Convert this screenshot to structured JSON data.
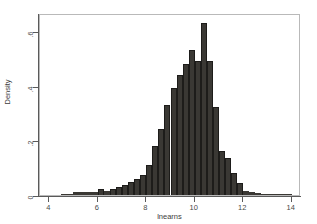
{
  "chart_data": {
    "type": "bar",
    "title": "",
    "subtitle": "",
    "xlabel": "lnearns",
    "ylabel": "Density",
    "xlim": [
      3.62,
      14.38
    ],
    "ylim": [
      0,
      0.665
    ],
    "grid": false,
    "legend": null,
    "bin_width": 0.25,
    "x_ticks": [
      {
        "value": 4,
        "label": "4"
      },
      {
        "value": 6,
        "label": "6"
      },
      {
        "value": 8,
        "label": "8"
      },
      {
        "value": 10,
        "label": "10"
      },
      {
        "value": 12,
        "label": "12"
      },
      {
        "value": 14,
        "label": "14"
      }
    ],
    "y_ticks": [
      {
        "value": 0,
        "label": "0"
      },
      {
        "value": 0.2,
        "label": ".2"
      },
      {
        "value": 0.4,
        "label": ".4"
      },
      {
        "value": 0.6,
        "label": ".6"
      }
    ],
    "bar_color": "#3a3834",
    "bar_edge_color": "#1d1c1a",
    "axis_color": "#5a5a5a",
    "frame_color": "#b9b9b9",
    "background_color": "#ffffff",
    "categories": [
      "4.50",
      "4.75",
      "5.00",
      "5.25",
      "5.50",
      "5.75",
      "6.00",
      "6.25",
      "6.50",
      "6.75",
      "7.00",
      "7.25",
      "7.50",
      "7.75",
      "8.00",
      "8.25",
      "8.50",
      "8.75",
      "9.00",
      "9.25",
      "9.50",
      "9.75",
      "10.00",
      "10.25",
      "10.50",
      "10.75",
      "11.00",
      "11.25",
      "11.50",
      "11.75",
      "12.00",
      "12.25",
      "12.50",
      "12.75",
      "13.00",
      "13.25",
      "13.50",
      "13.75"
    ],
    "values": [
      0.004,
      0.004,
      0.01,
      0.01,
      0.01,
      0.012,
      0.022,
      0.016,
      0.022,
      0.03,
      0.038,
      0.046,
      0.058,
      0.074,
      0.11,
      0.18,
      0.24,
      0.33,
      0.39,
      0.44,
      0.48,
      0.53,
      0.49,
      0.63,
      0.49,
      0.32,
      0.16,
      0.135,
      0.08,
      0.045,
      0.016,
      0.012,
      0.006,
      0.004,
      0.004,
      0.003,
      0.002,
      0.002
    ]
  }
}
